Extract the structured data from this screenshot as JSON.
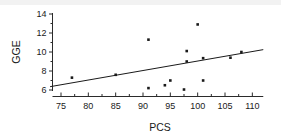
{
  "chart_data": {
    "type": "scatter",
    "title": "",
    "xlabel": "PCS",
    "ylabel": "GGE",
    "xlim": [
      73,
      112
    ],
    "ylim": [
      5.4,
      14.4
    ],
    "xticks": [
      75,
      80,
      85,
      90,
      95,
      100,
      105,
      110
    ],
    "yticks": [
      6,
      8,
      10,
      12,
      14
    ],
    "xtick_labels": [
      "75",
      "80",
      "85",
      "90",
      "95",
      "100",
      "105",
      "110"
    ],
    "ytick_labels": [
      "6",
      "8",
      "10",
      "12",
      "14"
    ],
    "minor_xticks": [
      77.5,
      82.5,
      87.5,
      92.5,
      97.5,
      102.5,
      107.5
    ],
    "minor_yticks": [
      7,
      9,
      11,
      13
    ],
    "grid": false,
    "legend": null,
    "marker": "filled-square",
    "marker_size": 2.6,
    "point_color": "#1a1a1a",
    "line_color": "#1a1a1a",
    "points": [
      {
        "x": 77.0,
        "y": 7.3
      },
      {
        "x": 85.0,
        "y": 7.6
      },
      {
        "x": 91.0,
        "y": 11.3
      },
      {
        "x": 91.0,
        "y": 6.2
      },
      {
        "x": 94.0,
        "y": 6.5
      },
      {
        "x": 95.0,
        "y": 7.0
      },
      {
        "x": 97.5,
        "y": 6.05
      },
      {
        "x": 98.0,
        "y": 10.1
      },
      {
        "x": 98.0,
        "y": 9.0
      },
      {
        "x": 100.0,
        "y": 12.9
      },
      {
        "x": 101.0,
        "y": 9.35
      },
      {
        "x": 101.0,
        "y": 7.0
      },
      {
        "x": 106.0,
        "y": 9.4
      },
      {
        "x": 108.0,
        "y": 10.0
      }
    ],
    "trend_line": {
      "type": "linear-fit",
      "x_start": 73.0,
      "y_start": 6.35,
      "x_end": 112.0,
      "y_end": 10.25
    }
  }
}
